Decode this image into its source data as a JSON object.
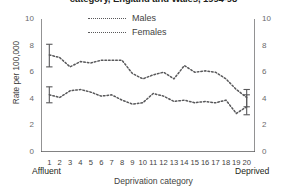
{
  "title": "category, England and Wales, 1994-98",
  "legend": {
    "items": [
      {
        "label": "Males",
        "marker": "dotted-line-marker"
      },
      {
        "label": "Females",
        "marker": "dotted-line-marker"
      }
    ]
  },
  "axes": {
    "ylabel": "Rate per 100,000",
    "xlabel": "Deprivation category",
    "left_end_label": "Affluent",
    "right_end_label": "Deprived",
    "yticks": [
      0,
      2,
      4,
      6,
      8,
      10
    ],
    "yticks_right": [
      0,
      2,
      4,
      6,
      8,
      10
    ],
    "xticks": [
      1,
      2,
      3,
      4,
      5,
      6,
      7,
      8,
      9,
      10,
      11,
      12,
      13,
      14,
      15,
      16,
      17,
      18,
      19,
      20
    ]
  },
  "colors": {
    "series": "#58585a",
    "axis": "#58585a",
    "text": "#231f20",
    "tick_text": "#6a6a6c",
    "background": "#ffffff"
  },
  "chart_data": {
    "type": "line",
    "title": "category, England and Wales, 1994-98",
    "xlabel": "Deprivation category",
    "ylabel": "Rate per 100,000",
    "xlim": [
      0.2,
      20.8
    ],
    "ylim": [
      0,
      10
    ],
    "grid": false,
    "legend_position": "top-center",
    "x": [
      1,
      2,
      3,
      4,
      5,
      6,
      7,
      8,
      9,
      10,
      11,
      12,
      13,
      14,
      15,
      16,
      17,
      18,
      19,
      20
    ],
    "series": [
      {
        "name": "Males",
        "values": [
          7.3,
          7.1,
          6.4,
          6.8,
          6.7,
          6.9,
          6.9,
          6.9,
          5.9,
          5.5,
          5.8,
          6.0,
          5.5,
          6.5,
          6.0,
          6.1,
          6.0,
          5.5,
          4.7,
          4.1
        ],
        "errorbars": [
          {
            "x": 1,
            "value": 7.3,
            "lower": 6.4,
            "upper": 8.1
          },
          {
            "x": 20,
            "value": 4.1,
            "lower": 3.4,
            "upper": 4.7
          }
        ]
      },
      {
        "name": "Females",
        "values": [
          4.3,
          4.1,
          4.6,
          4.7,
          4.5,
          4.2,
          4.3,
          3.9,
          3.6,
          3.7,
          4.4,
          4.2,
          3.8,
          3.9,
          3.7,
          3.8,
          3.7,
          3.9,
          2.9,
          3.4
        ],
        "errorbars": [
          {
            "x": 1,
            "value": 4.3,
            "lower": 3.7,
            "upper": 4.9
          },
          {
            "x": 20,
            "value": 3.4,
            "lower": 2.8,
            "upper": 4.3
          }
        ]
      }
    ]
  }
}
